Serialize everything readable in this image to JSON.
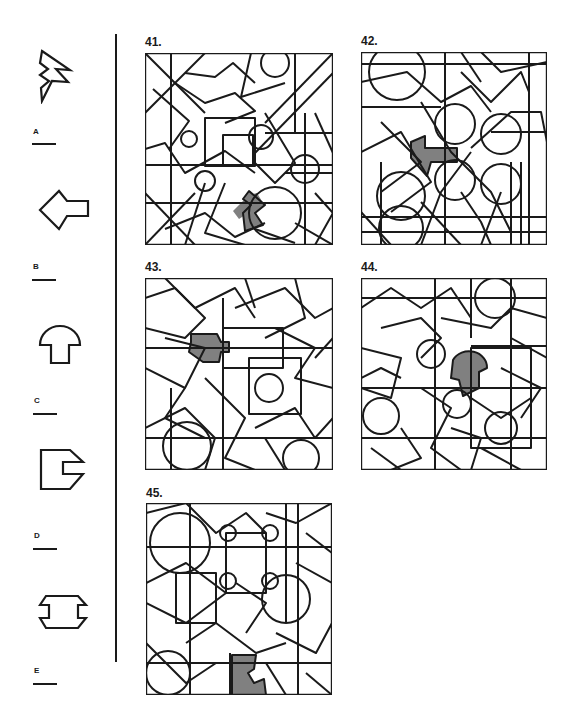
{
  "options": [
    {
      "letter": "A",
      "shape": "zigzag-chevron"
    },
    {
      "letter": "B",
      "shape": "diamond-with-stem"
    },
    {
      "letter": "C",
      "shape": "mushroom"
    },
    {
      "letter": "D",
      "shape": "notched-pentagon"
    },
    {
      "letter": "E",
      "shape": "spool"
    }
  ],
  "questions": [
    {
      "number": "41.",
      "shaded_color": "#808080"
    },
    {
      "number": "42.",
      "shaded_color": "#808080"
    },
    {
      "number": "43.",
      "shaded_color": "#808080"
    },
    {
      "number": "44.",
      "shaded_color": "#808080"
    },
    {
      "number": "45.",
      "shaded_color": "#808080"
    }
  ],
  "colors": {
    "ink": "#1a1a1a",
    "shade": "#808080",
    "background": "#ffffff"
  }
}
